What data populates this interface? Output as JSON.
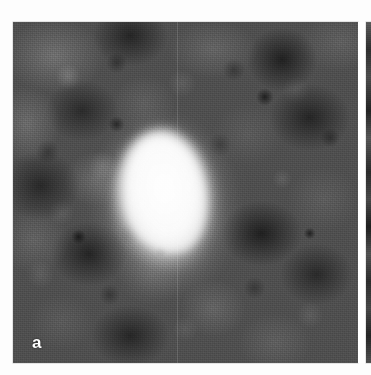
{
  "figure": {
    "caption_present": false,
    "background_color": "#ffffff",
    "panels": [
      {
        "id": "a",
        "label": "a",
        "label_color": "#ffffff",
        "label_position": "bottom-left",
        "modality_appearance": "grayscale speckled tissue field",
        "frame_color": "#a0a0a0",
        "background_tone": "#4f4f4f",
        "feature": {
          "name": "bright-lesion",
          "description": "bright ovoid high-intensity region near image center",
          "fill_color": "#ffffff",
          "halo_color": "#e6e6e6"
        },
        "x": 13,
        "y": 22,
        "width": 345,
        "height": 341
      },
      {
        "id": "b",
        "label": "",
        "label_color": "#ffffff",
        "modality_appearance": "grayscale speckled tissue field (cropped edge sliver)",
        "frame_color": "#a0a0a0",
        "background_tone": "#3d3d3d",
        "x": 366,
        "y": 22,
        "width": 5,
        "height": 341
      }
    ]
  },
  "chart_data": {
    "type": "heatmap",
    "title": "",
    "xlabel": "",
    "ylabel": "",
    "legend": [],
    "annotations": [
      "a"
    ],
    "colormap": "grayscale",
    "value_range": [
      0,
      255
    ]
  }
}
